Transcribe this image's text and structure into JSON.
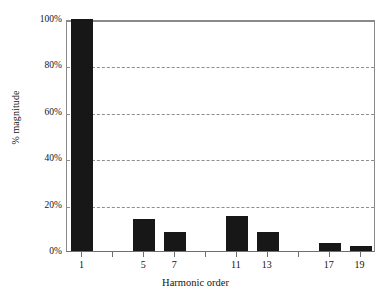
{
  "chart_data": {
    "type": "bar",
    "title": "",
    "subtitle": "",
    "xlabel": "Harmonic order",
    "ylabel": "% magnitude",
    "categories": [
      "1",
      "3",
      "5",
      "7",
      "9",
      "11",
      "13",
      "15",
      "17",
      "19"
    ],
    "values": [
      100,
      0,
      13.8,
      8.2,
      0,
      15,
      8,
      0,
      3.5,
      2
    ],
    "labeled_categories": [
      "1",
      "5",
      "7",
      "11",
      "13",
      "17",
      "19"
    ],
    "ylim": [
      0,
      100
    ],
    "y_ticks": [
      0,
      20,
      40,
      60,
      80,
      100
    ],
    "y_tick_labels": [
      "0%",
      "20%",
      "40%",
      "60%",
      "80%",
      "100%"
    ],
    "grid": true,
    "grid_axis": "y",
    "grid_style": "dashed",
    "legend": "none",
    "bar_color": "#171717",
    "background_color": "#ffffff",
    "axis_color": "#8a8a8a",
    "grid_color": "#8e8e8e"
  },
  "axes": {
    "y_title": "% magnitude",
    "x_title": "Harmonic order",
    "y_tick_labels": [
      "100%",
      "80%",
      "60%",
      "40%",
      "20%",
      "0%"
    ],
    "x_tick_labels": [
      "1",
      "5",
      "7",
      "11",
      "13",
      "17",
      "19"
    ]
  }
}
